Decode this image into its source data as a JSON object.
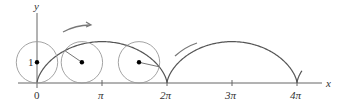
{
  "figure": {
    "axes": {
      "x_label": "x",
      "y_label": "y",
      "x_ticks": [
        "0",
        "π",
        "2π",
        "3π",
        "4π"
      ],
      "y_ticks": [
        "1"
      ]
    },
    "circles": [
      {
        "label": "circle-at-start",
        "t": 0
      },
      {
        "label": "circle-rolling-1",
        "t": 2.17
      },
      {
        "label": "circle-rolling-2",
        "t": 4.93
      }
    ],
    "arrows": [
      {
        "label": "rolling-direction-arrow-1"
      },
      {
        "label": "rolling-direction-arrow-2"
      }
    ],
    "colors": {
      "curve": "#555555",
      "circle": "#999999",
      "axis": "#666666",
      "arrow": "#777777",
      "dot": "#000000"
    }
  },
  "chart_data": {
    "type": "line",
    "title": "",
    "xlabel": "x",
    "ylabel": "y",
    "x_tick_labels": [
      "0",
      "π",
      "2π",
      "3π",
      "4π"
    ],
    "y_tick_labels": [
      "1"
    ],
    "xlim": [
      0,
      14
    ],
    "ylim": [
      0,
      2.5
    ],
    "series": [
      {
        "name": "cycloid x = t - sin t, y = 1 - cos t",
        "x": [
          0,
          0.43,
          1.57,
          3.14,
          4.71,
          5.85,
          6.28,
          6.71,
          7.85,
          9.42,
          11.0,
          12.13,
          12.57,
          13.7
        ],
        "y": [
          0,
          0.59,
          1.0,
          2.0,
          1.0,
          0.59,
          0,
          0.59,
          1.0,
          2.0,
          1.0,
          0.59,
          0,
          1.2
        ]
      }
    ],
    "grid": false,
    "legend": null
  }
}
